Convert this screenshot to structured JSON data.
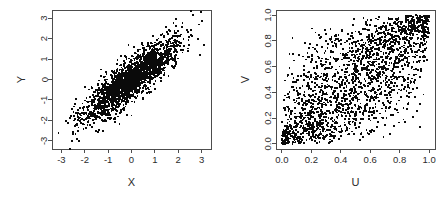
{
  "figure": {
    "background_color": "#ffffff",
    "point_color": "#0a0a0a",
    "axis_color": "#4d4d4d",
    "text_color": "#2b2b2b",
    "panel_count": 2
  },
  "chart_data": [
    {
      "type": "scatter",
      "panel_name": "normal-margins-scatter",
      "title": "",
      "xlabel": "X",
      "ylabel": "Y",
      "xlim": [
        -3.4,
        3.4
      ],
      "ylim": [
        -3.4,
        3.4
      ],
      "xticks": [
        -3,
        -2,
        -1,
        0,
        1,
        2,
        3
      ],
      "xticklabels": [
        "-3",
        "-2",
        "-1",
        "0",
        "1",
        "2",
        "3"
      ],
      "yticks": [
        -3,
        -2,
        -1,
        0,
        1,
        2,
        3
      ],
      "yticklabels": [
        "-3",
        "-2",
        "-1",
        "0",
        "1",
        "2",
        "3"
      ],
      "grid": false,
      "legend": null,
      "n_points": 2000,
      "marker": "filled-square",
      "marker_size_px": 1.8,
      "distribution": "bivariate-normal",
      "correlation": 0.85,
      "mean": [
        0,
        0
      ],
      "sd": [
        1,
        1
      ],
      "seed": 20240517
    },
    {
      "type": "scatter",
      "panel_name": "uniform-margins-copula-scatter",
      "title": "",
      "xlabel": "U",
      "ylabel": "V",
      "xlim": [
        -0.04,
        1.04
      ],
      "ylim": [
        -0.04,
        1.04
      ],
      "xticks": [
        0.0,
        0.2,
        0.4,
        0.6,
        0.8,
        1.0
      ],
      "xticklabels": [
        "0.0",
        "0.2",
        "0.4",
        "0.6",
        "0.8",
        "1.0"
      ],
      "yticks": [
        0.0,
        0.2,
        0.4,
        0.6,
        0.8,
        1.0
      ],
      "yticklabels": [
        "0.0",
        "0.2",
        "0.4",
        "0.6",
        "0.8",
        "1.0"
      ],
      "grid": false,
      "legend": null,
      "n_points": 2000,
      "marker": "filled-square",
      "marker_size_px": 1.8,
      "distribution": "gaussian-copula",
      "correlation": 0.72,
      "seed": 77310942
    }
  ]
}
